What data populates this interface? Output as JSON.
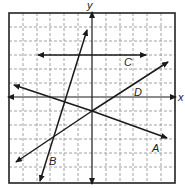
{
  "diagram": {
    "type": "coordinate-plane",
    "axes": {
      "x_label": "x",
      "y_label": "y"
    },
    "grid": {
      "columns": 12,
      "rows": 12,
      "style": "dashed"
    },
    "lines": [
      {
        "label": "A",
        "description": "decreasing line passing through (0,-1)"
      },
      {
        "label": "B",
        "description": "steep increasing line"
      },
      {
        "label": "C",
        "description": "horizontal line y = 3"
      },
      {
        "label": "D",
        "description": "increasing line passing through (0,-1)"
      }
    ],
    "colors": {
      "line": "#1a1a1a",
      "grid": "#888888",
      "frame": "#222222"
    }
  }
}
